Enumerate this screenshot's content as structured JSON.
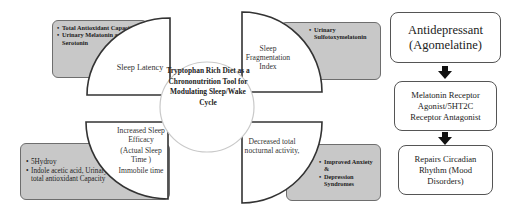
{
  "diagram": {
    "center": {
      "title": "Tryptophan Rich Diet as a Chrononutrition Tool for Modulating Sleep/Wake Cycle"
    },
    "quadrants": [
      {
        "position": "top-left",
        "label": "Sleep Latency",
        "markers": [
          "Total Antioxidant Capacity",
          "Urinary Melatonin and Serotonin"
        ]
      },
      {
        "position": "top-right",
        "label": "Sleep Fragmentation Index",
        "markers": [
          "Urinary Sulfotoxymelatonin"
        ]
      },
      {
        "position": "bottom-left",
        "label_lines": [
          "Increased Sleep Efficacy",
          "(Actual Sleep Time )",
          "Immobile time"
        ],
        "markers": [
          "5Hydroy",
          "Indole acetic acid, Urinary total antioxidant Capacity"
        ]
      },
      {
        "position": "bottom-right",
        "label": "Decreased total nocturnal activity,",
        "markers": [
          "Improved Anxiety &",
          "Depression Syndromes"
        ]
      }
    ],
    "flow": [
      "Antidepressant (Agomelatine)",
      "Melatonin Receptor Agonist/5HT2C Receptor Antagonist",
      "Repairs Circadian Rhythm (Mood Disorders)"
    ]
  }
}
